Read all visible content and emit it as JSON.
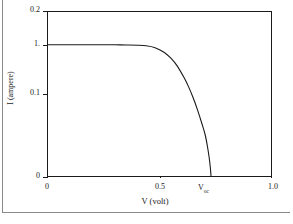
{
  "chart_data": {
    "type": "line",
    "title": "",
    "subtitle": "",
    "xlabel": "V (volt)",
    "ylabel": "I (ampere)",
    "xlim": [
      0,
      1.0
    ],
    "ylim": [
      0,
      0.2
    ],
    "grid": false,
    "legend": null,
    "x_ticks": [
      {
        "value": 0,
        "label": "0"
      },
      {
        "value": 0.5,
        "label": "0.5"
      },
      {
        "value": 1.0,
        "label": "1.0"
      }
    ],
    "y_ticks": [
      {
        "value": 0,
        "label": "0"
      },
      {
        "value": 0.1,
        "label": "0.1"
      },
      {
        "value": 0.16,
        "label": "1."
      },
      {
        "value": 0.2,
        "label": "0.2"
      }
    ],
    "annotations": [
      {
        "name": "voc-marker",
        "text": "V",
        "subscript": "oc",
        "x": 0.73,
        "y": 0
      }
    ],
    "series": [
      {
        "name": "I-V characteristic",
        "color": "#1a1a1a",
        "x": [
          0.0,
          0.05,
          0.1,
          0.15,
          0.2,
          0.25,
          0.3,
          0.35,
          0.4,
          0.44,
          0.48,
          0.52,
          0.55,
          0.58,
          0.61,
          0.63,
          0.65,
          0.67,
          0.69,
          0.705,
          0.715,
          0.723,
          0.728,
          0.731
        ],
        "y": [
          0.16,
          0.16,
          0.16,
          0.16,
          0.16,
          0.16,
          0.16,
          0.1598,
          0.1595,
          0.1588,
          0.1565,
          0.151,
          0.144,
          0.134,
          0.12,
          0.109,
          0.096,
          0.081,
          0.064,
          0.05,
          0.036,
          0.022,
          0.01,
          0.0
        ]
      }
    ]
  },
  "axes": {
    "y_title": "I (ampere)",
    "x_title": "V (volt)",
    "voc_base": "V",
    "voc_sub": "oc"
  }
}
